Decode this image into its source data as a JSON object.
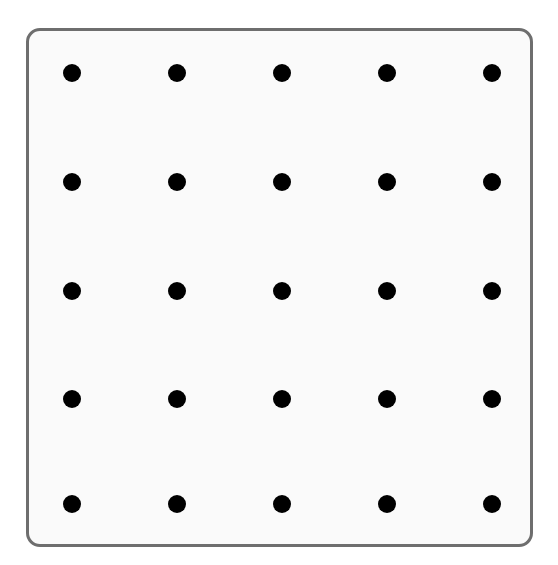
{
  "figure": {
    "title": "",
    "background_color": "#ffffff",
    "width": 558,
    "height": 565
  },
  "panel": {
    "name": "rounded-rectangle-panel",
    "fill_color": "#fafafa",
    "border_color": "#6e6e6e",
    "border_width_px": 3,
    "corner_radius_px": 14,
    "x": 26,
    "y": 28,
    "width": 507,
    "height": 519
  },
  "chart_data": {
    "type": "scatter",
    "title": "",
    "subtitle": "",
    "xlabel": "",
    "ylabel": "",
    "grid": false,
    "legend": null,
    "axis_visible": false,
    "tick_labels_x": [],
    "tick_labels_y": [],
    "marker": {
      "shape": "circle",
      "color": "#000000",
      "diameter_px": 18
    },
    "rows": 5,
    "columns": 5,
    "count": 25,
    "column_centers_px": [
      72,
      177,
      282,
      387,
      492
    ],
    "row_centers_px": [
      73,
      182,
      291,
      399,
      504
    ],
    "points": [
      {
        "id": "r1c1",
        "col": 1,
        "row": 1,
        "x": 72,
        "y": 73
      },
      {
        "id": "r1c2",
        "col": 2,
        "row": 1,
        "x": 177,
        "y": 73
      },
      {
        "id": "r1c3",
        "col": 3,
        "row": 1,
        "x": 282,
        "y": 73
      },
      {
        "id": "r1c4",
        "col": 4,
        "row": 1,
        "x": 387,
        "y": 73
      },
      {
        "id": "r1c5",
        "col": 5,
        "row": 1,
        "x": 492,
        "y": 73
      },
      {
        "id": "r2c1",
        "col": 1,
        "row": 2,
        "x": 72,
        "y": 182
      },
      {
        "id": "r2c2",
        "col": 2,
        "row": 2,
        "x": 177,
        "y": 182
      },
      {
        "id": "r2c3",
        "col": 3,
        "row": 2,
        "x": 282,
        "y": 182
      },
      {
        "id": "r2c4",
        "col": 4,
        "row": 2,
        "x": 387,
        "y": 182
      },
      {
        "id": "r2c5",
        "col": 5,
        "row": 2,
        "x": 492,
        "y": 182
      },
      {
        "id": "r3c1",
        "col": 1,
        "row": 3,
        "x": 72,
        "y": 291
      },
      {
        "id": "r3c2",
        "col": 2,
        "row": 3,
        "x": 177,
        "y": 291
      },
      {
        "id": "r3c3",
        "col": 3,
        "row": 3,
        "x": 282,
        "y": 291
      },
      {
        "id": "r3c4",
        "col": 4,
        "row": 3,
        "x": 387,
        "y": 291
      },
      {
        "id": "r3c5",
        "col": 5,
        "row": 3,
        "x": 492,
        "y": 291
      },
      {
        "id": "r4c1",
        "col": 1,
        "row": 4,
        "x": 72,
        "y": 399
      },
      {
        "id": "r4c2",
        "col": 2,
        "row": 4,
        "x": 177,
        "y": 399
      },
      {
        "id": "r4c3",
        "col": 3,
        "row": 4,
        "x": 282,
        "y": 399
      },
      {
        "id": "r4c4",
        "col": 4,
        "row": 4,
        "x": 387,
        "y": 399
      },
      {
        "id": "r4c5",
        "col": 5,
        "row": 4,
        "x": 492,
        "y": 399
      },
      {
        "id": "r5c1",
        "col": 1,
        "row": 5,
        "x": 72,
        "y": 504
      },
      {
        "id": "r5c2",
        "col": 2,
        "row": 5,
        "x": 177,
        "y": 504
      },
      {
        "id": "r5c3",
        "col": 3,
        "row": 5,
        "x": 282,
        "y": 504
      },
      {
        "id": "r5c4",
        "col": 4,
        "row": 5,
        "x": 387,
        "y": 504
      },
      {
        "id": "r5c5",
        "col": 5,
        "row": 5,
        "x": 492,
        "y": 504
      }
    ]
  }
}
